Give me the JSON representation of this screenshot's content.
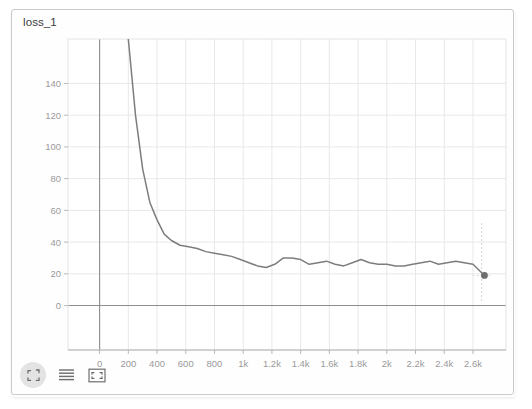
{
  "panel": {
    "title": "loss_1",
    "border_color": "#c9c9c9",
    "background": "#fefefe"
  },
  "toolbar": {
    "buttons": [
      {
        "name": "fit-domain-icon",
        "label": "Fit domain to data",
        "active": true
      },
      {
        "name": "list-lines-icon",
        "label": "Toggle y-axis log scale",
        "active": false
      },
      {
        "name": "expand-box-icon",
        "label": "Toggle expanded view",
        "active": false
      }
    ]
  },
  "chart_data": {
    "type": "line",
    "title": "loss_1",
    "xlabel": "",
    "ylabel": "",
    "grid": true,
    "legend_position": "none",
    "line_color": "#7d7d7d",
    "marker_color": "#6f6f6f",
    "axis_color": "#8a8a8a",
    "grid_color": "#e8e8ec",
    "xlim": [
      -220,
      2830
    ],
    "ylim": [
      -28,
      168
    ],
    "xtick_labels": [
      "0",
      "200",
      "400",
      "600",
      "800",
      "1k",
      "1.2k",
      "1.4k",
      "1.6k",
      "1.8k",
      "2k",
      "2.2k",
      "2.4k",
      "2.6k"
    ],
    "xtick_values": [
      0,
      200,
      400,
      600,
      800,
      1000,
      1200,
      1400,
      1600,
      1800,
      2000,
      2200,
      2400,
      2600
    ],
    "ytick_labels": [
      "0",
      "20",
      "40",
      "60",
      "80",
      "100",
      "120",
      "140"
    ],
    "ytick_values": [
      0,
      20,
      40,
      60,
      80,
      100,
      120,
      140
    ],
    "series": [
      {
        "name": "loss_1",
        "x": [
          180,
          200,
          250,
          300,
          350,
          400,
          450,
          500,
          560,
          620,
          680,
          740,
          800,
          860,
          920,
          980,
          1040,
          1100,
          1160,
          1220,
          1280,
          1340,
          1400,
          1460,
          1520,
          1580,
          1640,
          1700,
          1760,
          1820,
          1880,
          1940,
          2000,
          2060,
          2120,
          2180,
          2240,
          2300,
          2360,
          2420,
          2480,
          2540,
          2600,
          2680
        ],
        "y": [
          210,
          168,
          120,
          86,
          65,
          54,
          45,
          41,
          38,
          37,
          36,
          34,
          33,
          32,
          31,
          29,
          27,
          25,
          24,
          26,
          30,
          30,
          29,
          26,
          27,
          28,
          26,
          25,
          27,
          29,
          27,
          26,
          26,
          25,
          25,
          26,
          27,
          28,
          26,
          27,
          28,
          27,
          26,
          19
        ]
      }
    ],
    "end_marker": {
      "x": 2680,
      "y": 19
    },
    "crosshair": {
      "x": 2660,
      "visible": true
    },
    "clipped_above": true
  }
}
